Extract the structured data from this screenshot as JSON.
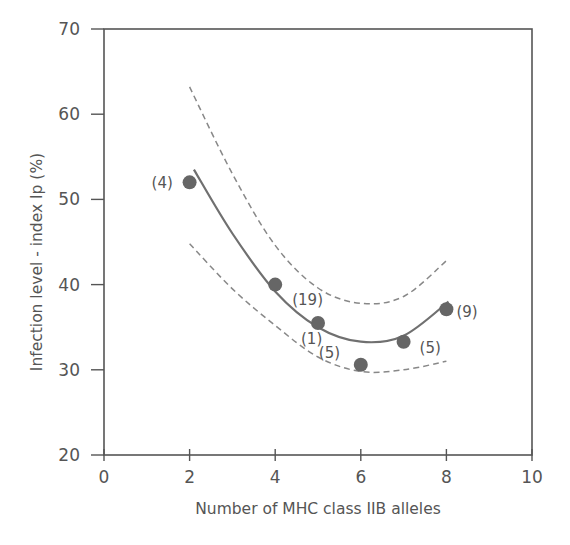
{
  "chart_data": {
    "type": "scatter",
    "title": "",
    "xlabel": "Number of MHC class IIB alleles",
    "ylabel": "Infection level - index Ip (%)",
    "xlim": [
      0,
      10
    ],
    "ylim": [
      20,
      70
    ],
    "xticks": [
      0,
      2,
      4,
      6,
      8,
      10
    ],
    "yticks": [
      20,
      30,
      40,
      50,
      60,
      70
    ],
    "grid": false,
    "legend": null,
    "points": [
      {
        "x": 2,
        "y": 52.0,
        "n_label": "(4)"
      },
      {
        "x": 4,
        "y": 40.0,
        "n_label": "(19)"
      },
      {
        "x": 5,
        "y": 35.5,
        "n_label": "(1)"
      },
      {
        "x": 6,
        "y": 30.6,
        "n_label": "(5)"
      },
      {
        "x": 7,
        "y": 33.3,
        "n_label": "(5)"
      },
      {
        "x": 8,
        "y": 37.1,
        "n_label": "(9)"
      }
    ],
    "series": [
      {
        "name": "fitted quadratic",
        "style": "solid",
        "x": [
          2.1,
          3,
          4,
          5,
          6,
          7,
          8.05
        ],
        "y": [
          53.5,
          46.0,
          39.2,
          35.0,
          33.3,
          34.0,
          38.0
        ]
      },
      {
        "name": "upper confidence band",
        "style": "dashed",
        "x": [
          2,
          3,
          4,
          5,
          6,
          7,
          8
        ],
        "y": [
          63.2,
          53.0,
          44.6,
          39.6,
          37.8,
          38.6,
          42.8
        ]
      },
      {
        "name": "lower confidence band",
        "style": "dashed",
        "x": [
          2,
          3,
          4,
          5,
          6,
          7,
          8
        ],
        "y": [
          44.8,
          39.5,
          35.2,
          31.5,
          29.8,
          30.0,
          31.0
        ]
      }
    ]
  },
  "colors": {
    "axis": "#555555",
    "point": "#666666",
    "fit_line": "#707070",
    "band_line": "#888888"
  }
}
